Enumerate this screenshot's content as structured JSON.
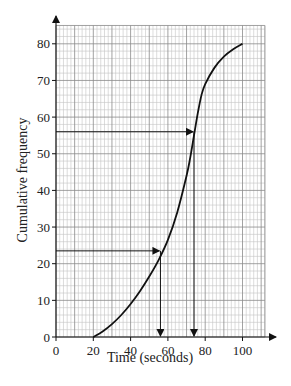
{
  "chart_data": {
    "type": "line",
    "title": "",
    "xlabel": "Time (seconds)",
    "ylabel": "Cumulative frequency",
    "xlim": [
      0,
      112
    ],
    "ylim": [
      0,
      85
    ],
    "x_ticks": [
      0,
      20,
      40,
      60,
      80,
      100
    ],
    "y_ticks": [
      0,
      10,
      20,
      30,
      40,
      50,
      60,
      70,
      80
    ],
    "grid": true,
    "grid_minor_step": 2,
    "grid_major_step": 10,
    "legend": null,
    "series": [
      {
        "name": "Cumulative frequency curve",
        "x": [
          20,
          25,
          30,
          35,
          40,
          45,
          50,
          55,
          60,
          65,
          70,
          72,
          74,
          76,
          78,
          80,
          85,
          90,
          95,
          100
        ],
        "y": [
          0,
          1.5,
          3.5,
          6,
          9,
          12.5,
          16.5,
          21,
          26.5,
          34,
          44,
          49,
          55,
          61,
          66,
          69,
          73.5,
          76.5,
          78.5,
          80
        ]
      }
    ],
    "annotations": [
      {
        "type": "arrow-line",
        "description": "horizontal from y-axis at 23.5 to curve",
        "y": 23.5,
        "x_end": 56
      },
      {
        "type": "arrow-line",
        "description": "vertical from curve down to x-axis",
        "x": 56,
        "y_start": 23.5
      },
      {
        "type": "arrow-line",
        "description": "horizontal from y-axis at 56 to curve",
        "y": 56,
        "x_end": 74
      },
      {
        "type": "arrow-line",
        "description": "vertical from curve down to x-axis",
        "x": 74,
        "y_start": 56
      }
    ]
  },
  "labels": {
    "xlabel": "Time (seconds)",
    "ylabel": "Cumulative frequency"
  }
}
